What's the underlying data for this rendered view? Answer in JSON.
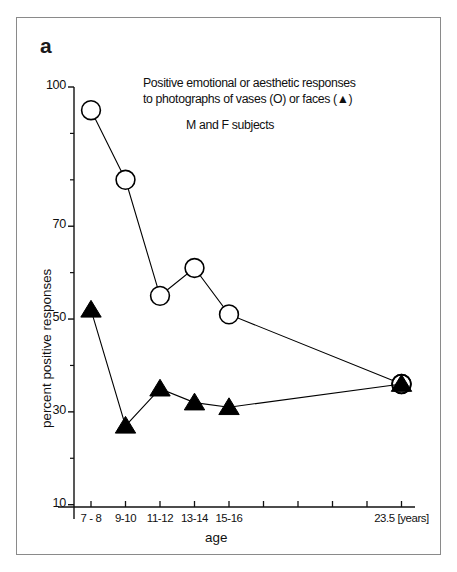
{
  "figure": {
    "panel_label": "a",
    "annotation_line1": "Positive emotional or aesthetic responses",
    "annotation_line2": "to photographs of vases (O) or faces (▲)",
    "annotation_subjects": "M and F subjects"
  },
  "chart_data": {
    "type": "line",
    "title": "Positive emotional or aesthetic responses to photographs of vases (O) or faces (▲)",
    "subtitle": "M and F subjects",
    "xlabel": "age",
    "ylabel": "percent positive responses",
    "x_unit_label": "[years]",
    "categories": [
      "7 - 8",
      "9-10",
      "11-12",
      "13-14",
      "15-16",
      "23.5"
    ],
    "xtick_labels": [
      "7 - 8",
      "9-10",
      "11-12",
      "13-14",
      "15-16",
      "23.5 [years]"
    ],
    "ytick_labels": [
      "100",
      "70",
      "50",
      "30",
      "10"
    ],
    "ytick_values": [
      100,
      70,
      50,
      30,
      10
    ],
    "yminor_values": [
      90,
      80,
      60,
      40,
      20
    ],
    "ylim": [
      5,
      102
    ],
    "grid": false,
    "legend_position": "none",
    "series": [
      {
        "name": "vases (O)",
        "marker": "circle-open",
        "color": "#000000",
        "values": [
          95,
          80,
          55,
          61,
          51,
          36
        ]
      },
      {
        "name": "faces (▲)",
        "marker": "triangle-filled",
        "color": "#000000",
        "values": [
          52,
          27,
          35,
          32,
          31,
          36
        ]
      }
    ]
  }
}
